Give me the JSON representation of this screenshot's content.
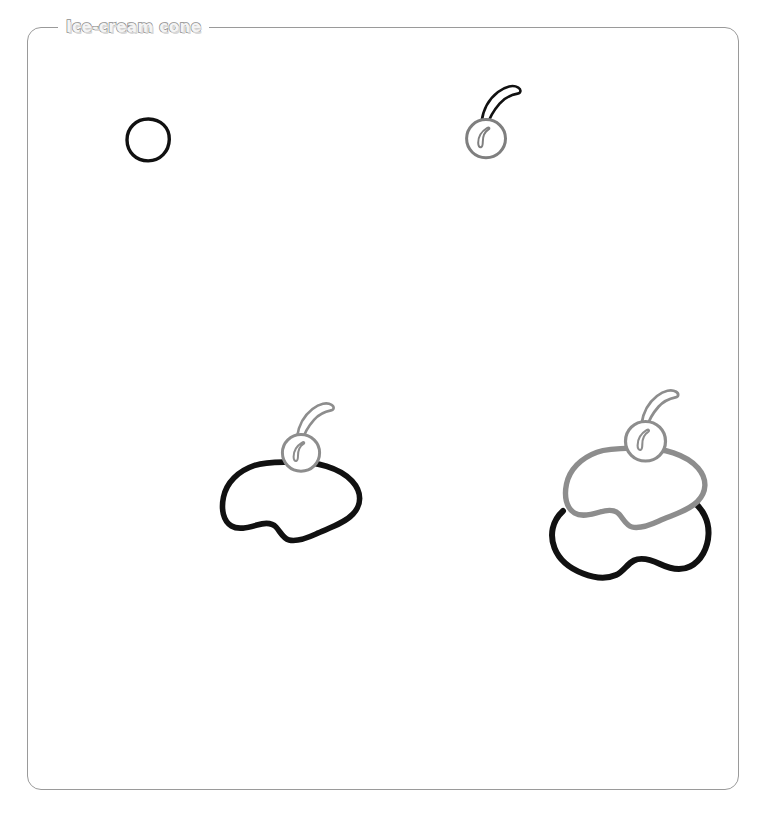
{
  "panel": {
    "title": "Ice-cream cone",
    "border_color": "#9a9a9a",
    "background": "#ffffff"
  },
  "palette": {
    "ink_current": "#111111",
    "ink_previous": "#8d8d8d",
    "paper": "#ffffff",
    "title_fill": "#f4f4f4",
    "title_outline": "#8e8e8e"
  },
  "canvas": {
    "name": "sketch-canvas",
    "width": 759,
    "height": 815
  },
  "steps": [
    {
      "index": 1,
      "name": "step-circle",
      "label": "circle",
      "stroke": "#111111",
      "center": [
        148,
        140
      ]
    },
    {
      "index": 2,
      "name": "step-cherry",
      "label": "cherry",
      "stroke_body": "#7f7f7f",
      "stroke_stem": "#111111",
      "center": [
        486,
        137
      ]
    },
    {
      "index": 3,
      "name": "step-scoop-one",
      "label": "first scoop with cherry",
      "stroke_new": "#111111",
      "stroke_prev": "#8d8d8d",
      "center": [
        292,
        495
      ]
    },
    {
      "index": 4,
      "name": "step-scoop-two",
      "label": "second scoop",
      "stroke_new": "#111111",
      "stroke_prev": "#8d8d8d",
      "center": [
        637,
        505
      ]
    }
  ]
}
